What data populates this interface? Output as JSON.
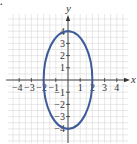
{
  "problem_marker": ".",
  "chart_data": {
    "type": "line",
    "title": "",
    "xlabel": "x",
    "ylabel": "y",
    "xlim": [
      -5,
      5
    ],
    "ylim": [
      -5,
      5
    ],
    "grid": true,
    "grid_step": 0.5,
    "x_ticks": [
      -4,
      -3,
      -2,
      -1,
      1,
      2,
      3,
      4
    ],
    "x_tick_labels": [
      "-4",
      "-3",
      "-2",
      "-1",
      "1",
      "2",
      "3",
      "4"
    ],
    "y_ticks": [
      -4,
      -3,
      -2,
      -1,
      1,
      2,
      3,
      4
    ],
    "y_tick_labels": [
      "-4",
      "-3",
      "-2",
      "-1",
      "1",
      "2",
      "3",
      "4"
    ],
    "series": [
      {
        "name": "ellipse",
        "shape": "ellipse",
        "center": [
          0,
          0
        ],
        "semi_axis_x": 2,
        "semi_axis_y": 4,
        "equation": "x^2/4 + y^2/16 = 1",
        "color": "#3d5a99"
      }
    ],
    "colors": {
      "grid": "#d9d9d9",
      "axis": "#333333",
      "curve": "#3d5a99"
    }
  }
}
